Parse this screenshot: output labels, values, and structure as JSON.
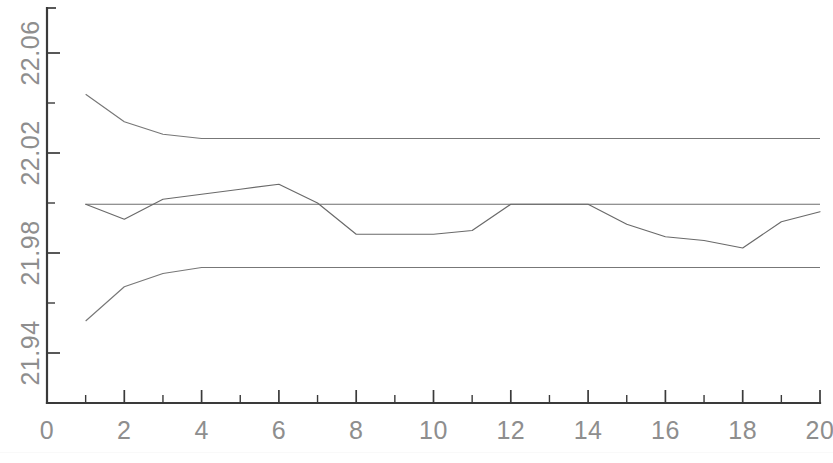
{
  "chart_data": {
    "type": "line",
    "title": "",
    "subtitle": "",
    "xlabel": "",
    "ylabel": "",
    "xlim": [
      0,
      20
    ],
    "ylim": [
      21.92,
      22.078
    ],
    "grid": false,
    "legend": null,
    "x_ticks_major": [
      0,
      2,
      4,
      6,
      8,
      10,
      12,
      14,
      16,
      18,
      20
    ],
    "x_tick_labels": [
      "0",
      "2",
      "4",
      "6",
      "8",
      "10",
      "12",
      "14",
      "16",
      "18",
      "20"
    ],
    "x_ticks_minor": [
      1,
      3,
      5,
      7,
      9,
      11,
      13,
      15,
      17,
      19
    ],
    "y_ticks_major": [
      21.94,
      21.98,
      22.02,
      22.06
    ],
    "y_tick_labels": [
      "21.94",
      "21.98",
      "22.02",
      "22.06"
    ],
    "y_ticks_minor": [
      21.92,
      21.96,
      22.0,
      22.04
    ],
    "x": [
      1,
      2,
      3,
      4,
      5,
      6,
      7,
      8,
      9,
      10,
      11,
      12,
      13,
      14,
      15,
      16,
      17,
      18,
      19,
      20
    ],
    "series": [
      {
        "name": "sample-mean",
        "kind": "data",
        "values": [
          21.9995,
          21.9935,
          22.0015,
          22.0035,
          22.0055,
          22.0075,
          22.0,
          21.9875,
          21.9875,
          21.9875,
          21.989,
          21.9995,
          21.9995,
          21.9995,
          21.9915,
          21.9865,
          21.985,
          21.982,
          21.9925,
          21.9965
        ]
      },
      {
        "name": "upper-control-limit-curve",
        "kind": "limit-curve",
        "values": [
          22.0435,
          22.0325,
          22.0275,
          22.0258,
          22.0258,
          22.0258,
          22.0258,
          22.0258,
          22.0258,
          22.0258,
          22.0258,
          22.0258,
          22.0258,
          22.0258,
          22.0258,
          22.0258,
          22.0258,
          22.0258,
          22.0258,
          22.0258
        ]
      },
      {
        "name": "lower-control-limit-curve",
        "kind": "limit-curve",
        "values": [
          21.9528,
          21.9665,
          21.9718,
          21.9742,
          21.9742,
          21.9742,
          21.9742,
          21.9742,
          21.9742,
          21.9742,
          21.9742,
          21.9742,
          21.9742,
          21.9742,
          21.9742,
          21.9742,
          21.9742,
          21.9742,
          21.9742,
          21.9742
        ]
      }
    ],
    "reference_lines": [
      {
        "name": "upper-control-limit",
        "label": "UCL",
        "value": 22.0258
      },
      {
        "name": "center-line",
        "label": "CL",
        "value": 21.9995
      },
      {
        "name": "lower-control-limit",
        "label": "LCL",
        "value": 21.9742
      }
    ],
    "colors": {
      "axis": "#3a3a3a",
      "series": "#6a6a6a",
      "limits": "#6e6e6e",
      "tick_text": "#8e8e8e",
      "background": "#ffffff"
    }
  }
}
